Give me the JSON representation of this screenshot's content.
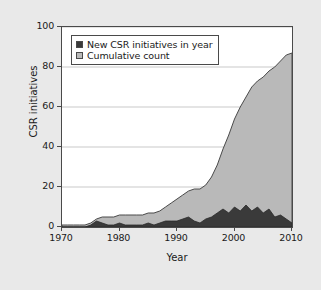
{
  "chart_data": {
    "type": "area",
    "title": "",
    "xlabel": "Year",
    "ylabel": "CSR initiatives",
    "xlim": [
      1970,
      2010
    ],
    "ylim": [
      0,
      100
    ],
    "xticks": [
      "1970",
      "1980",
      "1990",
      "2000",
      "2010"
    ],
    "yticks": [
      "0",
      "20",
      "40",
      "60",
      "80",
      "100"
    ],
    "grid": "horizontal",
    "legend_position": "upper-left-inside",
    "colors": {
      "new_initiatives": "#3a3a3a",
      "cumulative": "#b9b9b9",
      "axis": "#4a4a4a",
      "grid": "#c9c9c9",
      "background": "#e9e9e9",
      "plot_background": "#ffffff"
    },
    "x": [
      1970,
      1971,
      1972,
      1973,
      1974,
      1975,
      1976,
      1977,
      1978,
      1979,
      1980,
      1981,
      1982,
      1983,
      1984,
      1985,
      1986,
      1987,
      1988,
      1989,
      1990,
      1991,
      1992,
      1993,
      1994,
      1995,
      1996,
      1997,
      1998,
      1999,
      2000,
      2001,
      2002,
      2003,
      2004,
      2005,
      2006,
      2007,
      2008,
      2009,
      2010
    ],
    "series": [
      {
        "name": "Cumulative count",
        "values": [
          1,
          1,
          1,
          1,
          1,
          2,
          4,
          5,
          5,
          5,
          6,
          6,
          6,
          6,
          6,
          7,
          7,
          8,
          10,
          12,
          14,
          16,
          18,
          19,
          19,
          21,
          25,
          31,
          39,
          46,
          54,
          60,
          65,
          70,
          73,
          75,
          78,
          80,
          83,
          86,
          87
        ]
      },
      {
        "name": "New CSR initiatives in year",
        "values": [
          0,
          0,
          0,
          0,
          0,
          1,
          3,
          2,
          1,
          1,
          2,
          1,
          1,
          1,
          1,
          2,
          1,
          2,
          3,
          3,
          3,
          4,
          5,
          3,
          2,
          4,
          5,
          7,
          9,
          7,
          10,
          8,
          11,
          8,
          10,
          7,
          9,
          5,
          6,
          4,
          2
        ]
      }
    ]
  },
  "legend": {
    "items": [
      {
        "label": "New CSR initiatives in year",
        "color": "#3a3a3a"
      },
      {
        "label": "Cumulative count",
        "color": "#b9b9b9"
      }
    ]
  }
}
